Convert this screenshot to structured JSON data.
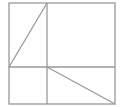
{
  "diagram": {
    "type": "geometry-figure",
    "stroke_color": "#999999",
    "background": "#ffffff",
    "outer_square": {
      "x": 9,
      "y": 3,
      "width": 106,
      "height": 101
    },
    "lines": [
      {
        "id": "vertical-divider",
        "x1": 47,
        "y1": 3,
        "x2": 47,
        "y2": 104
      },
      {
        "id": "horizontal-divider",
        "x1": 9,
        "y1": 67,
        "x2": 115,
        "y2": 67
      },
      {
        "id": "diagonal-top-left",
        "x1": 47,
        "y1": 3,
        "x2": 9,
        "y2": 67
      },
      {
        "id": "diagonal-bottom-right",
        "x1": 47,
        "y1": 67,
        "x2": 115,
        "y2": 104
      }
    ]
  }
}
